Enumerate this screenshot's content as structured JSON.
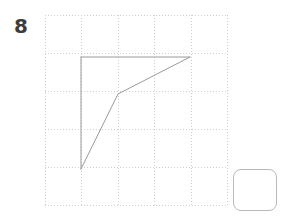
{
  "canvas": {
    "width": 285,
    "height": 216,
    "background": "#ffffff"
  },
  "prompt": {
    "label": "8",
    "color": "#3d3d3d"
  },
  "grid": {
    "color": "#cfcfcf",
    "style": "dotted",
    "origin_x": 45,
    "origin_y": 15,
    "cell_size": 36.5,
    "cols": 5,
    "rows": 5,
    "x_lines": [
      45,
      81.5,
      118,
      154.5,
      191,
      227.5
    ],
    "y_lines": [
      15,
      53,
      91,
      129,
      167,
      205
    ]
  },
  "drawing": {
    "stroke_color": "#9a9a9a",
    "stroke_width": 1,
    "shapes": [
      {
        "name": "top-edge",
        "type": "polyline",
        "points": [
          [
            81,
            57
          ],
          [
            190,
            57
          ]
        ]
      },
      {
        "name": "left-edge",
        "type": "polyline",
        "points": [
          [
            81,
            57
          ],
          [
            81,
            169
          ]
        ]
      },
      {
        "name": "hypotenuse",
        "type": "polyline",
        "points": [
          [
            81,
            169
          ],
          [
            118,
            94
          ],
          [
            190,
            57
          ]
        ]
      }
    ],
    "vertices": [
      {
        "name": "top-left",
        "x": 81,
        "y": 57
      },
      {
        "name": "top-right",
        "x": 190,
        "y": 57
      },
      {
        "name": "bend",
        "x": 118,
        "y": 94
      },
      {
        "name": "bottom-left",
        "x": 81,
        "y": 169
      }
    ]
  },
  "answer_box": {
    "name": "answer-box",
    "x": 233,
    "y": 169,
    "width": 44,
    "height": 42,
    "border_color": "#b9b9b9",
    "border_radius": 8,
    "fill": "#ffffff",
    "value": ""
  }
}
